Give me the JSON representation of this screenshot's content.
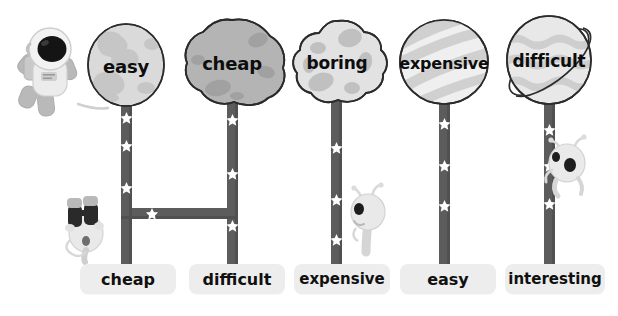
{
  "canvas": {
    "width": 618,
    "height": 316,
    "background": "#ffffff"
  },
  "theme": {
    "pole_color": "#5c5c5c",
    "pole_shadow": "#4a4a4a",
    "star_color": "#ffffff",
    "chip_bg": "#ededed",
    "chip_text": "#101010",
    "planet_text": "#0d0d0d",
    "outline": "#2b2b2b",
    "alien_body": "#e8e8e8",
    "alien_shade": "#c8c8c8",
    "astronaut_suit": "#e6e6e6",
    "astronaut_visor": "#141414"
  },
  "columns": [
    {
      "id": "column-1",
      "planet": {
        "name": "moon-planet",
        "label": "easy",
        "shape": "sphere-cratered",
        "fill": "#d9d9d9",
        "detail": "#c4c4c4",
        "center_x": 126,
        "center_y": 65,
        "radius_x": 38,
        "radius_y": 41,
        "label_font_size": 18
      },
      "pole": {
        "x": 121,
        "width": 11,
        "top": 104,
        "bottom": 266,
        "stars": [
          118,
          146,
          188
        ]
      },
      "chip": {
        "label": "cheap",
        "x": 80,
        "y": 264,
        "width": 96,
        "height": 30,
        "font_size": 16
      }
    },
    {
      "id": "column-2",
      "planet": {
        "name": "asteroid-planet",
        "label": "cheap",
        "shape": "asteroid-lumpy",
        "fill": "#b3b3b3",
        "detail": "#a0a0a0",
        "center_x": 232,
        "center_y": 62,
        "radius_x": 42,
        "radius_y": 42,
        "label_font_size": 18
      },
      "pole": {
        "x": 227,
        "width": 11,
        "top": 100,
        "bottom": 266,
        "stars": [
          120,
          174,
          226
        ]
      },
      "chip": {
        "label": "difficult",
        "x": 189,
        "y": 264,
        "width": 96,
        "height": 30,
        "font_size": 16
      }
    },
    {
      "id": "column-3",
      "planet": {
        "name": "cratered-moon-planet",
        "label": "boring",
        "shape": "sphere-bumpy",
        "fill": "#e0e0e0",
        "detail": "#c0c0c0",
        "center_x": 337,
        "center_y": 62,
        "radius_x": 40,
        "radius_y": 41,
        "label_font_size": 17
      },
      "pole": {
        "x": 331,
        "width": 11,
        "top": 100,
        "bottom": 266,
        "stars": [
          148,
          200,
          240
        ]
      },
      "chip": {
        "label": "expensive",
        "x": 294,
        "y": 264,
        "width": 96,
        "height": 30,
        "font_size": 16
      }
    },
    {
      "id": "column-4",
      "planet": {
        "name": "striped-gas-planet",
        "label": "expensive",
        "shape": "sphere-striped",
        "fill": "#ededed",
        "detail": "#cfcfcf",
        "center_x": 444,
        "center_y": 62,
        "radius_x": 44,
        "radius_y": 42,
        "label_font_size": 16
      },
      "pole": {
        "x": 439,
        "width": 11,
        "top": 101,
        "bottom": 266,
        "stars": [
          124,
          166,
          206
        ]
      },
      "chip": {
        "label": "easy",
        "x": 400,
        "y": 264,
        "width": 96,
        "height": 30,
        "font_size": 16
      }
    },
    {
      "id": "column-5",
      "planet": {
        "name": "ringed-planet",
        "label": "difficult",
        "shape": "sphere-ringed",
        "fill": "#e6e6e6",
        "detail": "#cccccc",
        "center_x": 549,
        "center_y": 60,
        "radius_x": 42,
        "radius_y": 44,
        "label_font_size": 17
      },
      "pole": {
        "x": 544,
        "width": 11,
        "top": 100,
        "bottom": 266,
        "stars": [
          130,
          166,
          204
        ]
      },
      "chip": {
        "label": "interesting",
        "x": 505,
        "y": 264,
        "width": 100,
        "height": 30,
        "font_size": 16
      }
    }
  ],
  "connectors": [
    {
      "name": "connector-bar-col1-col2",
      "x": 121,
      "y": 208,
      "width": 117,
      "height": 11
    }
  ],
  "characters": [
    {
      "name": "astronaut",
      "x": 14,
      "y": 28,
      "width": 74,
      "height": 84,
      "has_tether": true,
      "tether_to_x": 110,
      "tether_to_y": 108
    },
    {
      "name": "alien-with-binoculars",
      "x": 62,
      "y": 196,
      "width": 48,
      "height": 66
    },
    {
      "name": "alien-peeking-right",
      "x": 350,
      "y": 188,
      "width": 36,
      "height": 68
    },
    {
      "name": "alien-climbing-pole",
      "x": 540,
      "y": 140,
      "width": 42,
      "height": 60
    }
  ]
}
